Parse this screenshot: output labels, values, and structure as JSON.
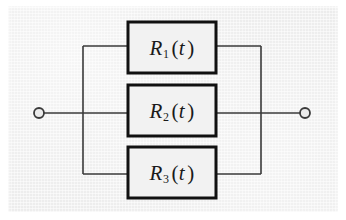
{
  "figure": {
    "kind": "reliability-block-diagram",
    "background_color": "#ebebeb",
    "line_color": "#3a3a3a",
    "block_border_color": "#111111",
    "block_fill_color": "#f2f2f2",
    "text_color": "#1a1a1a"
  },
  "terminals": {
    "left": {
      "name": "left-terminal",
      "cx": 39,
      "cy": 113,
      "r": 5
    },
    "right": {
      "name": "right-terminal",
      "cx": 305,
      "cy": 113,
      "r": 5
    }
  },
  "buses": {
    "left_x": 83,
    "right_x": 261,
    "top_y": 46,
    "bottom_y": 174,
    "mid_y": 113
  },
  "blocks": [
    {
      "id": "block-1",
      "symbol": "R",
      "subscript": "1",
      "open_paren": "(",
      "argument": "t",
      "close_paren": ")",
      "label_plain": "R1(t)",
      "x": 128,
      "y": 22,
      "width": 88,
      "height": 51,
      "branch_y": 46
    },
    {
      "id": "block-2",
      "symbol": "R",
      "subscript": "2",
      "open_paren": "(",
      "argument": "t",
      "close_paren": ")",
      "label_plain": "R2(t)",
      "x": 128,
      "y": 85,
      "width": 88,
      "height": 51,
      "branch_y": 113
    },
    {
      "id": "block-3",
      "symbol": "R",
      "subscript": "3",
      "open_paren": "(",
      "argument": "t",
      "close_paren": ")",
      "label_plain": "R3(t)",
      "x": 128,
      "y": 147,
      "width": 88,
      "height": 51,
      "branch_y": 174
    }
  ]
}
